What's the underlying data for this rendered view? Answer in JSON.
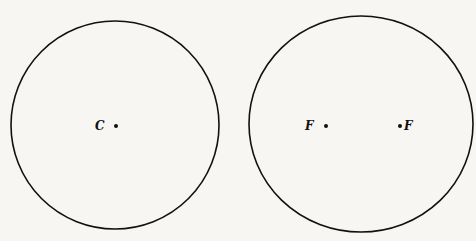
{
  "figure": {
    "background": "#f7f6f3",
    "stroke_color": "#111111",
    "left_circle": {
      "description": "circle with single center point",
      "center_label": "C"
    },
    "right_circle": {
      "description": "ellipse-like circle with two foci",
      "focus_left_label": "F",
      "focus_right_label": "F"
    }
  }
}
